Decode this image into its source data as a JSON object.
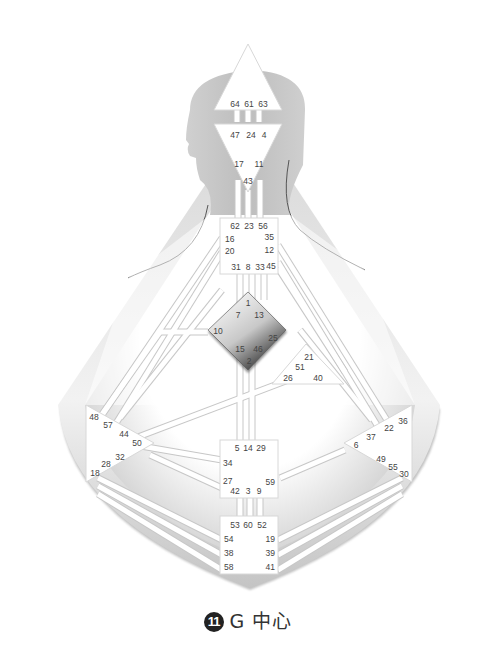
{
  "caption": {
    "number": "11",
    "text": "G 中心"
  },
  "highlighted_center": "G",
  "colors": {
    "body_fill": "#c9c9c9",
    "center_fill": "#ffffff",
    "highlight_dark": "#3a3a3a",
    "channel": "#ffffff",
    "channel_edge": "#bdbdbd",
    "text": "#444444"
  },
  "centers": {
    "head": {
      "name": "Head",
      "gates": [
        "64",
        "61",
        "63"
      ]
    },
    "ajna": {
      "name": "Ajna",
      "gates": [
        "47",
        "24",
        "4",
        "17",
        "11",
        "43"
      ]
    },
    "throat": {
      "name": "Throat",
      "gates": [
        "62",
        "23",
        "56",
        "16",
        "35",
        "20",
        "12",
        "31",
        "8",
        "33",
        "45"
      ]
    },
    "g": {
      "name": "G",
      "gates": [
        "1",
        "7",
        "13",
        "10",
        "25",
        "15",
        "46",
        "2"
      ]
    },
    "heart": {
      "name": "Heart",
      "gates": [
        "21",
        "51",
        "26",
        "40"
      ]
    },
    "spleen": {
      "name": "Spleen",
      "gates": [
        "48",
        "57",
        "44",
        "50",
        "32",
        "28",
        "18"
      ]
    },
    "solar": {
      "name": "Solar Plexus",
      "gates": [
        "36",
        "22",
        "37",
        "6",
        "49",
        "55",
        "30"
      ]
    },
    "sacral": {
      "name": "Sacral",
      "gates": [
        "5",
        "14",
        "29",
        "34",
        "27",
        "59",
        "42",
        "3",
        "9"
      ]
    },
    "root": {
      "name": "Root",
      "gates": [
        "53",
        "60",
        "52",
        "54",
        "19",
        "38",
        "39",
        "58",
        "41"
      ]
    }
  }
}
